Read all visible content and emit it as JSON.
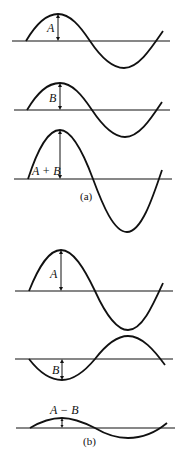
{
  "figure": {
    "part_a": {
      "caption": "(a)",
      "waves": [
        {
          "name": "wave-A",
          "label": "A",
          "baseline": 41,
          "amplitude": 27
        },
        {
          "name": "wave-B",
          "label": "B",
          "baseline": 110,
          "amplitude": 27
        },
        {
          "name": "wave-A-plus-B",
          "label": "A + B",
          "baseline": 179,
          "amplitude": 52
        }
      ]
    },
    "part_b": {
      "caption": "(b)",
      "waves": [
        {
          "name": "wave-A",
          "label": "A",
          "baseline": 291,
          "amplitude": 40
        },
        {
          "name": "wave-B-inverted",
          "label": "B",
          "baseline": 359,
          "amplitude": -22
        },
        {
          "name": "wave-A-minus-B",
          "label": "A − B",
          "baseline": 428,
          "amplitude": 10
        }
      ]
    }
  }
}
